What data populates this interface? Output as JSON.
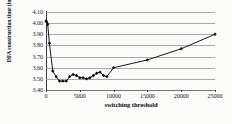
{
  "chart_data": {
    "type": "line",
    "title": "",
    "xlabel": "switching threshold",
    "ylabel": "DFA construction time (in seconds)",
    "xlim": [
      0,
      25000
    ],
    "ylim": [
      3.4,
      4.1
    ],
    "grid": true,
    "legend": null,
    "y_ticks": [
      "4.10",
      "4.00",
      "3.90",
      "3.80",
      "3.70",
      "3.60",
      "3.50",
      "3.40"
    ],
    "y_tick_values": [
      4.1,
      4.0,
      3.9,
      3.8,
      3.7,
      3.6,
      3.5,
      3.4
    ],
    "x_ticks": [
      "0",
      "5000",
      "10000",
      "15000",
      "20000",
      "25000"
    ],
    "x_tick_values": [
      0,
      5000,
      10000,
      15000,
      20000,
      25000
    ],
    "marker": "diamond",
    "series": [
      {
        "name": "DFA construction time",
        "x": [
          0,
          100,
          250,
          500,
          1000,
          1500,
          2000,
          2500,
          3000,
          3500,
          4000,
          4500,
          5000,
          5500,
          6000,
          6500,
          7000,
          7500,
          8000,
          8500,
          9000,
          10000,
          15000,
          20000,
          25000
        ],
        "y": [
          4.02,
          4.01,
          3.99,
          3.82,
          3.57,
          3.52,
          3.48,
          3.48,
          3.48,
          3.52,
          3.54,
          3.53,
          3.51,
          3.51,
          3.5,
          3.51,
          3.53,
          3.55,
          3.56,
          3.53,
          3.52,
          3.6,
          3.67,
          3.77,
          3.9
        ]
      }
    ]
  },
  "colors": {
    "line": "#1a1a1a",
    "marker": "#0d0d0d",
    "grid": "#8d8d8d",
    "axis": "#3a3a3a",
    "background": "#fbfbfa",
    "text": "#111111"
  }
}
